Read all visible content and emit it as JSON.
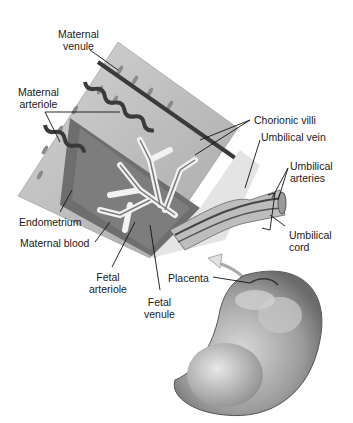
{
  "diagram": {
    "labels": {
      "maternal_venule": [
        "Maternal",
        "venule"
      ],
      "maternal_arteriole": [
        "Maternal",
        "arteriole"
      ],
      "chorionic_villi": "Chorionic villi",
      "umbilical_vein": "Umbilical vein",
      "umbilical_arteries": [
        "Umbilical",
        "arteries"
      ],
      "umbilical_cord": [
        "Umbilical",
        "cord"
      ],
      "endometrium": "Endometrium",
      "maternal_blood": "Maternal blood",
      "fetal_arteriole": [
        "Fetal",
        "arteriole"
      ],
      "fetal_venule": [
        "Fetal",
        "venule"
      ],
      "placenta": "Placenta"
    },
    "colors": {
      "tissue_light": "#c9c9c9",
      "tissue_mid": "#9a9a9a",
      "tissue_dark": "#5e5e5e",
      "vessel": "#3a3a3a",
      "leader_line": "#111111"
    }
  }
}
